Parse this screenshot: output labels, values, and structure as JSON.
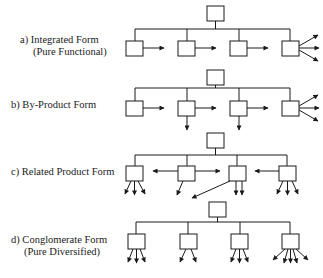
{
  "diagram": {
    "panels": [
      {
        "id": "a",
        "label": "a)  Integrated Form",
        "sublabel": "(Pure Functional)",
        "top": 6,
        "description": "Four child units each with one horizontal output arrow; last unit has three fanned arrows"
      },
      {
        "id": "b",
        "label": "b) By-Product Form",
        "sublabel": "",
        "top": 70,
        "description": "Four units with horizontal output arrows; units 2 and 3 also have downward by-product arrows; last unit fans three arrows"
      },
      {
        "id": "c",
        "label": "c)  Related Product Form",
        "sublabel": "",
        "top": 133,
        "description": "Units exchange with neighbors via horizontal arrows and each has multiple downward output arrows"
      },
      {
        "id": "d",
        "label": "d)  Conglomerate Form",
        "sublabel": "(Pure Diversified)",
        "top": 202,
        "description": "Four independent units each with several fanned downward output arrows"
      }
    ],
    "caption": "Figure (caption cut off)",
    "colors": {
      "line": "#1a1a1a",
      "box_fill": "#ffffff",
      "background": "#ffffff"
    }
  }
}
